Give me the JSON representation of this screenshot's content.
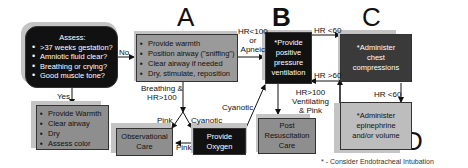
{
  "section_letters": {
    "a": "A",
    "b": "B",
    "c": "C",
    "d": "D"
  },
  "assess_box": {
    "title": "Assess:",
    "items": [
      ">37 weeks gestation?",
      "Amniotic fluid clear?",
      "Breathing or crying?",
      "Good muscle tone?"
    ]
  },
  "box_a": {
    "items": [
      "Provide warmth",
      "Position airway (\"sniffing\")",
      "Clear airway if needed",
      "Dry, stimulate, reposition"
    ]
  },
  "box_b": {
    "lines": [
      "*Provide",
      "positive",
      "pressure",
      "ventilation"
    ]
  },
  "box_c": {
    "lines": [
      "*Administer",
      "chest",
      "compressions"
    ]
  },
  "box_d": {
    "lines": [
      "*Administer",
      "epinephrine",
      "and/or volume"
    ]
  },
  "routine_box": {
    "items": [
      "Provide Warmth",
      "Clear airway",
      "Dry",
      "Assess color"
    ]
  },
  "observational_box": {
    "lines": [
      "Observational",
      "Care"
    ]
  },
  "oxygen_box": {
    "lines": [
      "Provide",
      "Oxygen"
    ]
  },
  "post_resus_box": {
    "lines": [
      "Post",
      "Resuscitation",
      "Care"
    ]
  },
  "edge_labels": {
    "no": "No",
    "yes": "Yes",
    "hr100_apneic": [
      "HR<100",
      "or",
      "Apneic"
    ],
    "breathing_hr100": [
      "Breathing &",
      "HR>100"
    ],
    "pink_left": "Pink",
    "cyanotic_mid": "Cyanotic",
    "cyanotic_up": "Cyanotic",
    "pink_bottom": "Pink",
    "hr_lt60_top": "HR <60",
    "hr_gt60": "HR >60",
    "hr_gt100_vent": [
      "HR>100",
      "Ventilating",
      "& Pink"
    ],
    "hr_lt60_right": "HR <60"
  },
  "footnote": "* - Consider Endotracheal Intubation",
  "colors": {
    "black_box": "#111111",
    "dark_gray_box": "#3a3a3a",
    "gray_box": "#9a9a9a",
    "light_gray_box": "#bdbdbd",
    "shadow": "#c4c4c4"
  }
}
